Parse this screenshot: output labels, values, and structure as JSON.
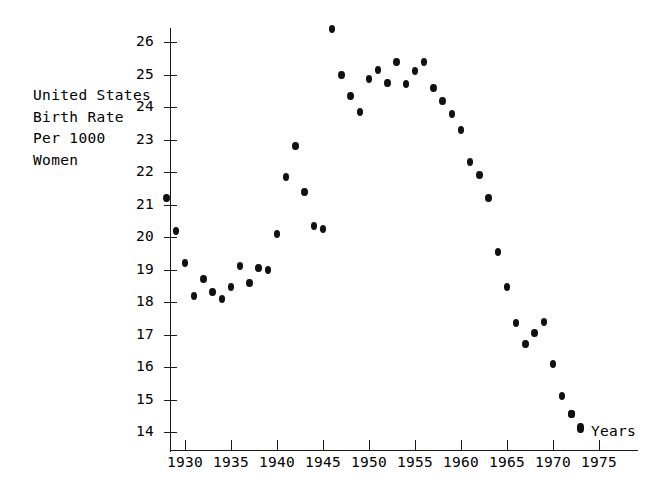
{
  "chart_data": {
    "type": "scatter",
    "title": "",
    "ylabel": "United States\nBirth Rate\nPer 1000\nWomen",
    "xlabel": "Years",
    "xlim": [
      1927.5,
      1977
    ],
    "ylim": [
      13.4,
      26.8
    ],
    "grid": false,
    "legend": null,
    "x_ticks": [
      1930,
      1935,
      1940,
      1945,
      1950,
      1955,
      1960,
      1965,
      1970,
      1975
    ],
    "y_ticks": [
      14,
      15,
      16,
      17,
      18,
      19,
      20,
      21,
      22,
      23,
      24,
      25,
      26
    ],
    "marker": "filled-circle",
    "marker_color": "#111111",
    "axis_color": "#1a1a1a",
    "x": [
      1928,
      1929,
      1930,
      1931,
      1932,
      1933,
      1934,
      1935,
      1936,
      1937,
      1938,
      1939,
      1940,
      1941,
      1942,
      1943,
      1944,
      1945,
      1946,
      1947,
      1948,
      1949,
      1950,
      1951,
      1952,
      1953,
      1954,
      1955,
      1956,
      1957,
      1958,
      1959,
      1960,
      1961,
      1962,
      1963,
      1964,
      1965,
      1966,
      1967,
      1968,
      1969,
      1970,
      1971,
      1972,
      1973
    ],
    "y": [
      21.2,
      20.2,
      19.2,
      18.2,
      18.7,
      18.3,
      18.1,
      18.45,
      19.1,
      18.6,
      19.05,
      19.0,
      20.1,
      21.85,
      22.8,
      21.4,
      20.35,
      20.25,
      26.4,
      25.0,
      24.35,
      23.85,
      24.85,
      25.15,
      24.75,
      25.4,
      24.7,
      25.1,
      25.4,
      24.6,
      24.2,
      23.8,
      23.3,
      22.3,
      21.9,
      21.2,
      19.55,
      18.45,
      17.35,
      16.7,
      17.05,
      17.4,
      16.1,
      15.1,
      14.55,
      14.15
    ],
    "extra_points": [
      {
        "x": 1972.0,
        "y": 14.55
      },
      {
        "x": 1973.0,
        "y": 14.1
      }
    ]
  },
  "axis_titles": {
    "y": "United States\nBirth Rate\nPer 1000\nWomen",
    "x": "Years"
  }
}
